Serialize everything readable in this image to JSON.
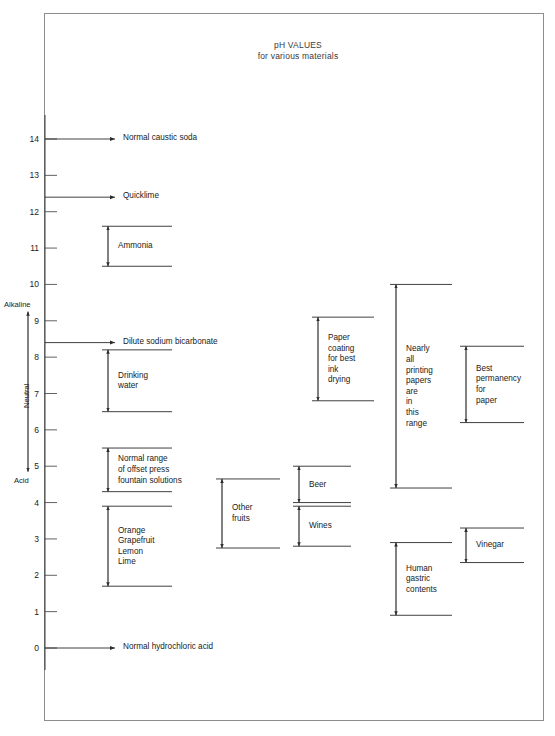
{
  "title": {
    "line1": "pH VALUES",
    "line2": "for various materials"
  },
  "axis": {
    "min": 0,
    "max": 14,
    "ticks": [
      "14",
      "13",
      "12",
      "11",
      "10",
      "9",
      "8",
      "7",
      "6",
      "5",
      "4",
      "3",
      "2",
      "1",
      "0"
    ],
    "alkaline_label": "Alkaline",
    "neutral_label": "Neutral",
    "acid_label": "Acid"
  },
  "chart_data": {
    "type": "range-bar",
    "xlabel": "",
    "ylabel": "pH",
    "ylim": [
      0,
      14
    ],
    "grid": false,
    "legend": null,
    "pointers": [
      {
        "label": "Normal caustic soda",
        "value": 14.0
      },
      {
        "label": "Quicklime",
        "value": 12.4
      },
      {
        "label": "Dilute sodium bicarbonate",
        "value": 8.4
      },
      {
        "label": "Normal hydrochloric acid",
        "value": 0.0
      }
    ],
    "ranges": [
      {
        "label": "Ammonia",
        "lines": [
          "Ammonia"
        ],
        "low": 10.5,
        "high": 11.6,
        "column": 1
      },
      {
        "label": "Drinking water",
        "lines": [
          "Drinking",
          "water"
        ],
        "low": 6.5,
        "high": 8.2,
        "column": 1
      },
      {
        "label": "Normal range of offset press fountain solutions",
        "lines": [
          "Normal range",
          "of offset press",
          "fountain solutions"
        ],
        "low": 4.3,
        "high": 5.5,
        "column": 1
      },
      {
        "label": "Orange Grapefruit Lemon Lime",
        "lines": [
          "Orange",
          "Grapefruit",
          "Lemon",
          "Lime"
        ],
        "low": 1.7,
        "high": 3.9,
        "column": 1
      },
      {
        "label": "Other fruits",
        "lines": [
          "Other",
          "fruits"
        ],
        "low": 2.75,
        "high": 4.65,
        "column": 2
      },
      {
        "label": "Beer",
        "lines": [
          "Beer"
        ],
        "low": 4.0,
        "high": 5.0,
        "column": 3
      },
      {
        "label": "Wines",
        "lines": [
          "Wines"
        ],
        "low": 2.8,
        "high": 3.9,
        "column": 3
      },
      {
        "label": "Paper coating for best ink drying",
        "lines": [
          "Paper",
          "coating",
          "for best",
          "ink",
          "drying"
        ],
        "low": 6.8,
        "high": 9.1,
        "column": 4
      },
      {
        "label": "Nearly all printing papers are in this range",
        "lines": [
          "Nearly",
          "all",
          "printing",
          "papers",
          "are",
          "in",
          "this",
          "range"
        ],
        "low": 4.4,
        "high": 10.0,
        "column": 5
      },
      {
        "label": "Human gastric contents",
        "lines": [
          "Human",
          "gastric",
          "contents"
        ],
        "low": 0.9,
        "high": 2.9,
        "column": 5
      },
      {
        "label": "Best permanency for paper",
        "lines": [
          "Best",
          "permanency",
          "for",
          "paper"
        ],
        "low": 6.2,
        "high": 8.3,
        "column": 6
      },
      {
        "label": "Vinegar",
        "lines": [
          "Vinegar"
        ],
        "low": 2.35,
        "high": 3.3,
        "column": 6
      }
    ]
  }
}
